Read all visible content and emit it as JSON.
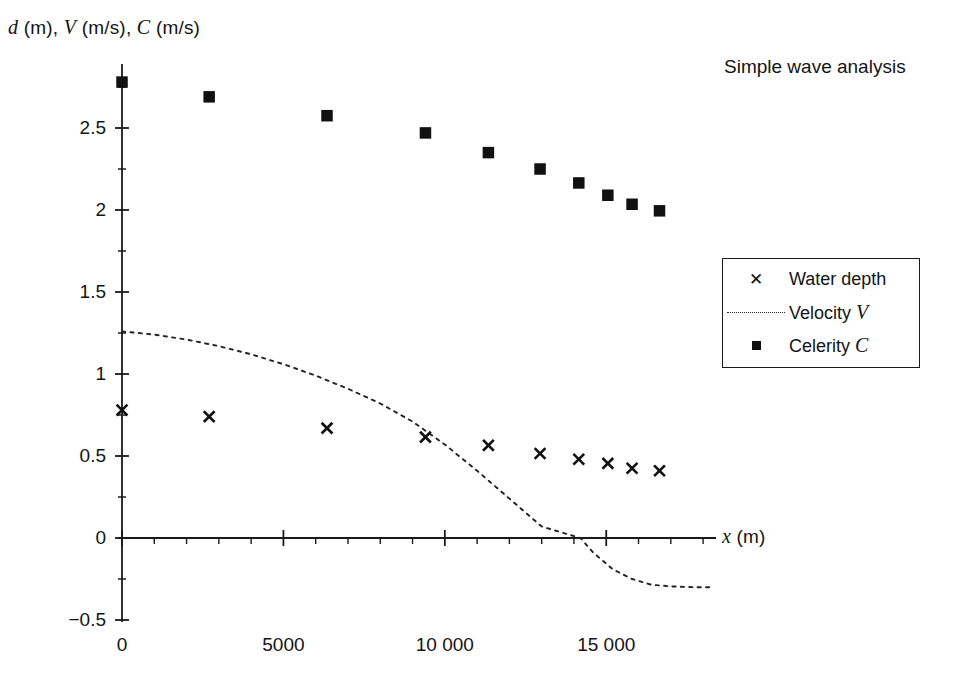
{
  "chart_data": {
    "type": "scatter",
    "title": "Simple wave analysis",
    "ylabel": "d (m), V (m/s), C (m/s)",
    "xlabel": "x (m)",
    "xlim": [
      0,
      18400
    ],
    "ylim": [
      -0.5,
      2.85
    ],
    "grid": false,
    "legend_position": "right",
    "x_major_ticks": [
      0,
      5000,
      10000,
      15000
    ],
    "x_major_tick_labels": [
      "0",
      "5000",
      "10 000",
      "15 000"
    ],
    "x_minor_tick_step": 1000,
    "y_major_ticks": [
      -0.5,
      0,
      0.5,
      1,
      1.5,
      2,
      2.5
    ],
    "y_major_tick_labels": [
      "−0.5",
      "0",
      "0.5",
      "1",
      "1.5",
      "2",
      "2.5"
    ],
    "y_minor_tick_step": 0.25,
    "series": [
      {
        "name": "Water depth",
        "marker": "x",
        "style": "markers",
        "points": [
          {
            "x": 0,
            "y": 0.78
          },
          {
            "x": 2700,
            "y": 0.74
          },
          {
            "x": 6350,
            "y": 0.67
          },
          {
            "x": 9400,
            "y": 0.615
          },
          {
            "x": 11350,
            "y": 0.565
          },
          {
            "x": 12950,
            "y": 0.515
          },
          {
            "x": 14150,
            "y": 0.48
          },
          {
            "x": 15050,
            "y": 0.455
          },
          {
            "x": 15800,
            "y": 0.425
          },
          {
            "x": 16650,
            "y": 0.41
          }
        ]
      },
      {
        "name": "Velocity V",
        "marker": "dotted-line",
        "style": "line",
        "points": [
          {
            "x": 0,
            "y": 1.26
          },
          {
            "x": 1000,
            "y": 1.24
          },
          {
            "x": 2000,
            "y": 1.21
          },
          {
            "x": 3000,
            "y": 1.17
          },
          {
            "x": 4000,
            "y": 1.12
          },
          {
            "x": 5000,
            "y": 1.06
          },
          {
            "x": 6000,
            "y": 0.99
          },
          {
            "x": 7000,
            "y": 0.91
          },
          {
            "x": 8000,
            "y": 0.82
          },
          {
            "x": 9000,
            "y": 0.71
          },
          {
            "x": 10000,
            "y": 0.57
          },
          {
            "x": 11000,
            "y": 0.41
          },
          {
            "x": 12000,
            "y": 0.24
          },
          {
            "x": 13000,
            "y": 0.07
          },
          {
            "x": 14200,
            "y": 0.0
          },
          {
            "x": 14600,
            "y": -0.09
          },
          {
            "x": 15200,
            "y": -0.19
          },
          {
            "x": 15800,
            "y": -0.25
          },
          {
            "x": 16400,
            "y": -0.285
          },
          {
            "x": 17000,
            "y": -0.295
          },
          {
            "x": 17700,
            "y": -0.3
          },
          {
            "x": 18200,
            "y": -0.3
          }
        ]
      },
      {
        "name": "Celerity C",
        "marker": "square",
        "style": "markers",
        "points": [
          {
            "x": 0,
            "y": 2.78
          },
          {
            "x": 2700,
            "y": 2.69
          },
          {
            "x": 6350,
            "y": 2.575
          },
          {
            "x": 9400,
            "y": 2.47
          },
          {
            "x": 11350,
            "y": 2.35
          },
          {
            "x": 12950,
            "y": 2.25
          },
          {
            "x": 14150,
            "y": 2.165
          },
          {
            "x": 15050,
            "y": 2.09
          },
          {
            "x": 15800,
            "y": 2.035
          },
          {
            "x": 16650,
            "y": 1.995
          }
        ]
      }
    ]
  },
  "legend": {
    "items": [
      {
        "label": "Water depth",
        "symbol": "x-marker"
      },
      {
        "label": "Velocity V",
        "symbol": "dotted-line"
      },
      {
        "label": "Celerity C",
        "symbol": "square-marker"
      }
    ]
  },
  "colors": {
    "ink": "#111111",
    "background": "#ffffff"
  }
}
